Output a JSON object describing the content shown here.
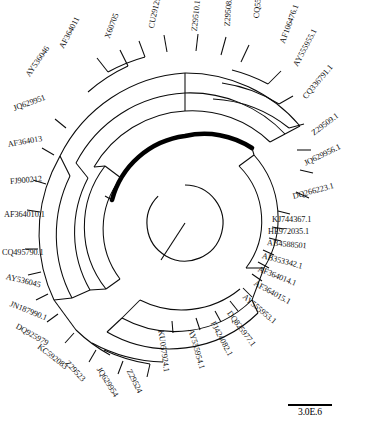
{
  "figure": {
    "type": "circular-phylogenetic-tree",
    "title": "",
    "scale_bar": {
      "label": "3.0E.6",
      "shown": true
    },
    "center": {
      "x": 185,
      "y": 223
    },
    "root_angle_deg": 235,
    "highlighted_branch": {
      "color": "#000000",
      "style": "bold-thick-arc",
      "radius": 74,
      "start_deg": 302,
      "end_deg": 170
    }
  },
  "taxa": [
    {
      "id": "AY536046",
      "label": "AY536046",
      "x": 28,
      "y": 72,
      "rot": -55
    },
    {
      "id": "AF364011",
      "label": "AF364011",
      "x": 62,
      "y": 44,
      "rot": -62
    },
    {
      "id": "X60705",
      "label": "X60705",
      "x": 108,
      "y": 34,
      "rot": -70
    },
    {
      "id": "CU291250",
      "label": "CU291250",
      "x": 152,
      "y": 24,
      "rot": -78
    },
    {
      "id": "Z29510.1",
      "label": "Z29510.1",
      "x": 195,
      "y": 27,
      "rot": -84
    },
    {
      "id": "Z29508.1",
      "label": "Z29508.1",
      "x": 228,
      "y": 22,
      "rot": -86
    },
    {
      "id": "CQ556790.1",
      "label": "CQ556790.1",
      "x": 257,
      "y": 14,
      "rot": -84
    },
    {
      "id": "AF106476.1",
      "label": "AF106476.1",
      "x": 283,
      "y": 39,
      "rot": -70
    },
    {
      "id": "AY555955.1",
      "label": "AY555955.1",
      "x": 296,
      "y": 62,
      "rot": -62
    },
    {
      "id": "CQ336791.1",
      "label": "CQ336791.1",
      "x": 305,
      "y": 94,
      "rot": -50
    },
    {
      "id": "Z29509.1",
      "label": "Z29509.1",
      "x": 313,
      "y": 130,
      "rot": -37
    },
    {
      "id": "JQ629956.1",
      "label": "JQ629956.1",
      "x": 305,
      "y": 160,
      "rot": -26
    },
    {
      "id": "DQ266223.1",
      "label": "DQ266223.1",
      "x": 293,
      "y": 193,
      "rot": -15
    },
    {
      "id": "KJ744367.1",
      "label": "KJ744367.1",
      "x": 272,
      "y": 216,
      "rot": 0
    },
    {
      "id": "HE972035.1",
      "label": "HE972035.1",
      "x": 268,
      "y": 228,
      "rot": 0
    },
    {
      "id": "AB4588501",
      "label": "AB4588501",
      "x": 267,
      "y": 239,
      "rot": 5
    },
    {
      "id": "AB353342.1",
      "label": "AB353342.1",
      "x": 262,
      "y": 252,
      "rot": 15
    },
    {
      "id": "AF364014.1",
      "label": "AF364014.1",
      "x": 258,
      "y": 265,
      "rot": 22
    },
    {
      "id": "AF364015.1",
      "label": "AF364015.1",
      "x": 254,
      "y": 279,
      "rot": 29
    },
    {
      "id": "AY555953.1",
      "label": "AY555953.1",
      "x": 243,
      "y": 292,
      "rot": 40
    },
    {
      "id": "DQ825977.1",
      "label": "DQ825977.1",
      "x": 228,
      "y": 308,
      "rot": 53
    },
    {
      "id": "FJ424082.1",
      "label": "FJ424082.1",
      "x": 212,
      "y": 318,
      "rot": 62
    },
    {
      "id": "AY555954.1",
      "label": "AY555954.1",
      "x": 190,
      "y": 325,
      "rot": 74
    },
    {
      "id": "KU057924.1",
      "label": "KU057924.1",
      "x": 160,
      "y": 326,
      "rot": 82
    },
    {
      "id": "Z29524",
      "label": "Z29524",
      "x": 128,
      "y": 366,
      "rot": 63
    },
    {
      "id": "JQ629954",
      "label": "JQ629954",
      "x": 98,
      "y": 364,
      "rot": 58
    },
    {
      "id": "Z29523",
      "label": "Z29523",
      "x": 66,
      "y": 358,
      "rot": 47
    },
    {
      "id": "KC592083",
      "label": "KC592083",
      "x": 38,
      "y": 342,
      "rot": 38
    },
    {
      "id": "DQ925979",
      "label": "DQ925979",
      "x": 16,
      "y": 322,
      "rot": 30
    },
    {
      "id": "JN187990.1",
      "label": "JN187990.1",
      "x": 10,
      "y": 300,
      "rot": 22
    },
    {
      "id": "AY536045",
      "label": "AY536045",
      "x": 6,
      "y": 273,
      "rot": 14
    },
    {
      "id": "CQ495790.1",
      "label": "CQ495790.1",
      "x": 2,
      "y": 249,
      "rot": 0
    },
    {
      "id": "AF364010.1",
      "label": "AF364010.1",
      "x": 4,
      "y": 211,
      "rot": 0
    },
    {
      "id": "FJ900212",
      "label": "FJ900212",
      "x": 10,
      "y": 178,
      "rot": -5
    },
    {
      "id": "AF364013",
      "label": "AF364013",
      "x": 8,
      "y": 141,
      "rot": -10
    },
    {
      "id": "JQ629951",
      "label": "JQ629951",
      "x": 14,
      "y": 105,
      "rot": -20
    }
  ],
  "arcs_note": "Nested concentric clade arcs drawn radially from center with radial connector spokes to each taxon tip."
}
